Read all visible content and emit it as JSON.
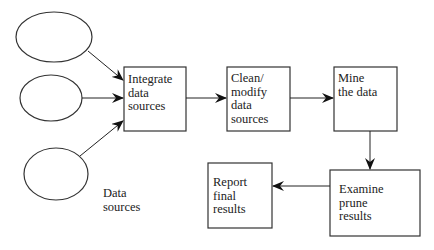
{
  "diagram": {
    "type": "flowchart",
    "colors": {
      "stroke": "#333333",
      "text": "#222222",
      "background": "#ffffff"
    },
    "sources": [
      {
        "id": "source-1",
        "shape": "ellipse"
      },
      {
        "id": "source-2",
        "shape": "ellipse"
      },
      {
        "id": "source-3",
        "shape": "ellipse"
      }
    ],
    "sources_label": "Data\nsources",
    "nodes": [
      {
        "id": "integrate",
        "label": "Integrate\ndata\nsources"
      },
      {
        "id": "clean",
        "label": "Clean/\nmodify\ndata\nsources"
      },
      {
        "id": "mine",
        "label": "Mine\nthe data"
      },
      {
        "id": "examine",
        "label": "Examine\nprune\nresults"
      },
      {
        "id": "report",
        "label": "Report\nfinal\nresults"
      }
    ],
    "edges": [
      {
        "from": "source-1",
        "to": "integrate"
      },
      {
        "from": "source-2",
        "to": "integrate"
      },
      {
        "from": "source-3",
        "to": "integrate"
      },
      {
        "from": "integrate",
        "to": "clean"
      },
      {
        "from": "clean",
        "to": "mine"
      },
      {
        "from": "mine",
        "to": "examine"
      },
      {
        "from": "examine",
        "to": "report"
      }
    ]
  }
}
